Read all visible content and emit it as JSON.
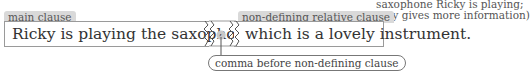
{
  "labels": {
    "main_clause_tag": "main clause",
    "relative_clause_tag": "non-defining relative clause"
  },
  "sentence": {
    "main_clause": "Ricky is playing the saxophone",
    "comma_symbol": ",",
    "relative_clause": "which is a lovely instrument."
  },
  "note": {
    "line1": "saxophone Ricky is playing;",
    "line2": "only gives more information)"
  },
  "callout": {
    "text": "comma before non-defining clause"
  },
  "colors": {
    "tag_bg": "#d9d9d9",
    "box_border": "#9a9a9a",
    "comma_circle": "#c8c8c8"
  }
}
